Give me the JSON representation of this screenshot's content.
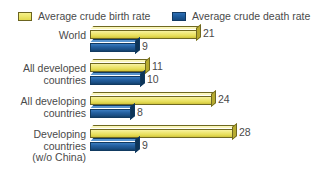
{
  "chart_data": {
    "type": "bar",
    "orientation": "horizontal",
    "title": "",
    "subtitle": "",
    "xlabel": "",
    "ylabel": "",
    "grid": false,
    "legend_position": "top",
    "xlim": [
      0,
      28
    ],
    "categories": [
      "World",
      "All developed\ncountries",
      "All developing\ncountries",
      "Developing\ncountries\n(w/o China)"
    ],
    "series": [
      {
        "name": "Average crude birth rate",
        "color": "#efe878",
        "values": [
          21,
          11,
          24,
          28
        ]
      },
      {
        "name": "Average crude death rate",
        "color": "#1f5d9e",
        "values": [
          9,
          10,
          8,
          9
        ]
      }
    ]
  },
  "legend": {
    "birth": {
      "label": "Average crude birth rate",
      "swatch_name": "legend-swatch-birth-rate",
      "color": "#efe878"
    },
    "death": {
      "label": "Average crude death rate",
      "swatch_name": "legend-swatch-death-rate",
      "color": "#1f5d9e"
    }
  },
  "groups": [
    {
      "label": "World",
      "birth_value": "21",
      "death_value": "9",
      "birth_num": 21,
      "death_num": 9
    },
    {
      "label": "All developed\ncountries",
      "birth_value": "11",
      "death_value": "10",
      "birth_num": 11,
      "death_num": 10
    },
    {
      "label": "All developing\ncountries",
      "birth_value": "24",
      "death_value": "8",
      "birth_num": 24,
      "death_num": 8
    },
    {
      "label": "Developing\ncountries\n(w/o China)",
      "birth_value": "28",
      "death_value": "9",
      "birth_num": 28,
      "death_num": 9
    }
  ],
  "style": {
    "background": "#ffffff",
    "text_color": "#4a4a4a",
    "px_per_unit": 5.1,
    "bar_origin_x": 90
  }
}
